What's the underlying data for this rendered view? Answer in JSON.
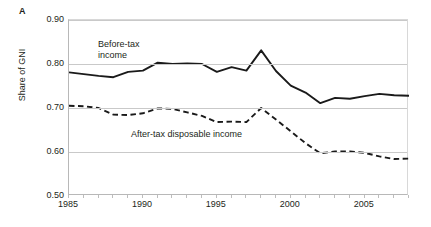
{
  "figure": {
    "panel_label": "A",
    "y_axis_title": "Share of GNI"
  },
  "annotations": {
    "before_tax": "Before-tax\nincome",
    "after_tax": "After-tax disposable income"
  },
  "axes": {
    "y_ticks": [
      "0.90",
      "0.80",
      "0.70",
      "0.60",
      "0.50"
    ],
    "x_ticks": [
      "1985",
      "1990",
      "1995",
      "2000",
      "2005"
    ]
  },
  "chart_data": {
    "type": "line",
    "title": "",
    "subtitle": "",
    "xlabel": "",
    "ylabel": "Share of GNI",
    "xlim": [
      1985,
      2008
    ],
    "ylim": [
      0.5,
      0.9
    ],
    "ytick_values": [
      0.9,
      0.8,
      0.7,
      0.6,
      0.5
    ],
    "xtick_values": [
      1985,
      1990,
      1995,
      2000,
      2005
    ],
    "grid": "horizontal",
    "legend_position": "inline-annotations",
    "x": [
      1985,
      1986,
      1987,
      1988,
      1989,
      1990,
      1991,
      1992,
      1993,
      1994,
      1995,
      1996,
      1997,
      1998,
      1999,
      2000,
      2001,
      2002,
      2003,
      2004,
      2005,
      2006,
      2007,
      2008
    ],
    "series": [
      {
        "name": "Before-tax income",
        "style": "solid",
        "color": "#1a1a1a",
        "values": [
          0.781,
          0.777,
          0.773,
          0.77,
          0.782,
          0.785,
          0.803,
          0.8,
          0.801,
          0.8,
          0.782,
          0.793,
          0.785,
          0.831,
          0.784,
          0.751,
          0.735,
          0.711,
          0.723,
          0.721,
          0.727,
          0.732,
          0.729,
          0.728
        ]
      },
      {
        "name": "After-tax disposable income",
        "style": "dashed",
        "color": "#1a1a1a",
        "values": [
          0.705,
          0.704,
          0.7,
          0.685,
          0.684,
          0.688,
          0.699,
          0.698,
          0.69,
          0.682,
          0.668,
          0.669,
          0.668,
          0.7,
          0.674,
          0.647,
          0.62,
          0.597,
          0.601,
          0.601,
          0.598,
          0.59,
          0.584,
          0.585
        ]
      }
    ]
  }
}
